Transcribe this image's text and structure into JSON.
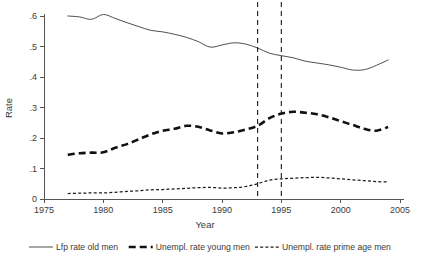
{
  "chart_data": {
    "type": "line",
    "title": "",
    "xlabel": "Year",
    "ylabel": "Rate",
    "xlim": [
      1975,
      2005
    ],
    "ylim": [
      0,
      0.62
    ],
    "xticks": [
      1975,
      1980,
      1985,
      1990,
      1995,
      2000,
      2005
    ],
    "xtick_labels": [
      "1975",
      "1980",
      "1985",
      "1990",
      "1995",
      "2000",
      "2005"
    ],
    "yticks": [
      0,
      0.1,
      0.2,
      0.3,
      0.4,
      0.5,
      0.6
    ],
    "ytick_labels": [
      "0",
      ".1",
      ".2",
      ".3",
      ".4",
      ".5",
      ".6"
    ],
    "grid": false,
    "legend_position": "below",
    "annotations": [
      {
        "name": "vertical-reference-line-1993",
        "type": "vline",
        "x": 1993,
        "style": "dashed"
      },
      {
        "name": "vertical-reference-line-1995",
        "type": "vline",
        "x": 1995,
        "style": "dashed"
      }
    ],
    "x": [
      1977,
      1978,
      1979,
      1980,
      1981,
      1982,
      1983,
      1984,
      1985,
      1986,
      1987,
      1988,
      1989,
      1990,
      1991,
      1992,
      1993,
      1994,
      1995,
      1996,
      1997,
      1998,
      1999,
      2000,
      2001,
      2002,
      2003,
      2004
    ],
    "series": [
      {
        "name": "Lfp rate old men",
        "style": "solid",
        "values": [
          0.6,
          0.597,
          0.589,
          0.605,
          0.592,
          0.578,
          0.565,
          0.553,
          0.548,
          0.54,
          0.53,
          0.516,
          0.498,
          0.505,
          0.512,
          0.508,
          0.495,
          0.478,
          0.47,
          0.463,
          0.452,
          0.446,
          0.44,
          0.432,
          0.423,
          0.424,
          0.438,
          0.456
        ]
      },
      {
        "name": "Unempl. rate young men",
        "style": "thick-dashed",
        "values": [
          0.145,
          0.15,
          0.152,
          0.153,
          0.168,
          0.18,
          0.196,
          0.212,
          0.224,
          0.23,
          0.24,
          0.237,
          0.225,
          0.215,
          0.219,
          0.228,
          0.24,
          0.265,
          0.28,
          0.286,
          0.283,
          0.278,
          0.268,
          0.255,
          0.243,
          0.23,
          0.224,
          0.236
        ]
      },
      {
        "name": "Unempl. rate prime age men",
        "style": "fine-dotted",
        "values": [
          0.018,
          0.019,
          0.02,
          0.02,
          0.022,
          0.025,
          0.027,
          0.03,
          0.031,
          0.033,
          0.035,
          0.037,
          0.038,
          0.036,
          0.037,
          0.041,
          0.05,
          0.062,
          0.066,
          0.068,
          0.07,
          0.071,
          0.069,
          0.066,
          0.063,
          0.06,
          0.057,
          0.056
        ]
      }
    ]
  },
  "legend": {
    "items": [
      {
        "label": "Lfp rate old men",
        "style": "solid"
      },
      {
        "label": "Unempl. rate young men",
        "style": "thick-dashed"
      },
      {
        "label": "Unempl. rate prime age men",
        "style": "fine-dotted"
      }
    ]
  }
}
